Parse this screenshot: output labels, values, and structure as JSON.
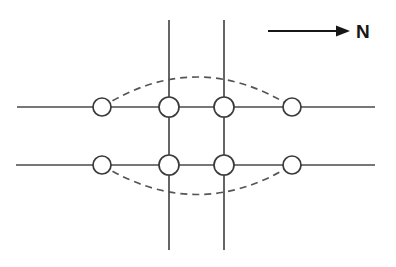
{
  "figure": {
    "background_color": "#ffffff",
    "line_color": "#4a4a4a",
    "node_stroke_color": "#3a3a3a",
    "node_fill_color": "#ffffff",
    "dashed_color": "#555555",
    "arrow_color": "#161616",
    "width": 396,
    "height": 267
  },
  "orientation": {
    "label": "N",
    "arrow_direction": "right",
    "arrow_start_x": 268,
    "arrow_end_x": 348,
    "arrow_y": 31,
    "label_x": 356,
    "label_y": 38
  },
  "roads": {
    "horizontal": [
      {
        "name": "upper-horizontal-road",
        "y": 107,
        "x_start": 17,
        "x_end": 375
      },
      {
        "name": "lower-horizontal-road",
        "y": 165,
        "x_start": 16,
        "x_end": 375
      }
    ],
    "vertical": [
      {
        "name": "left-vertical-road",
        "x": 169,
        "y_start": 20,
        "y_end": 250
      },
      {
        "name": "right-vertical-road",
        "x": 224,
        "y_start": 20,
        "y_end": 250
      }
    ]
  },
  "nodes": [
    {
      "id": "n1",
      "label": "upper-left-outer-node",
      "cx": 102,
      "cy": 107,
      "r": 9
    },
    {
      "id": "n2",
      "label": "upper-left-inner-node",
      "cx": 169,
      "cy": 107,
      "r": 10
    },
    {
      "id": "n3",
      "label": "upper-right-inner-node",
      "cx": 224,
      "cy": 107,
      "r": 10
    },
    {
      "id": "n4",
      "label": "upper-right-outer-node",
      "cx": 292,
      "cy": 107,
      "r": 9
    },
    {
      "id": "n5",
      "label": "lower-left-outer-node",
      "cx": 102,
      "cy": 165,
      "r": 9
    },
    {
      "id": "n6",
      "label": "lower-left-inner-node",
      "cx": 169,
      "cy": 165,
      "r": 10
    },
    {
      "id": "n7",
      "label": "lower-right-inner-node",
      "cx": 224,
      "cy": 165,
      "r": 10
    },
    {
      "id": "n8",
      "label": "lower-right-outer-node",
      "cx": 292,
      "cy": 165,
      "r": 9
    }
  ],
  "dashed_boundary": {
    "name": "dashed-lens-boundary",
    "shape": "lens",
    "left_x": 102,
    "right_x": 292,
    "top_peak_y": 68,
    "bottom_peak_y": 203,
    "upper_arc_y": 107,
    "lower_arc_y": 165,
    "dash_pattern": "7 5"
  }
}
